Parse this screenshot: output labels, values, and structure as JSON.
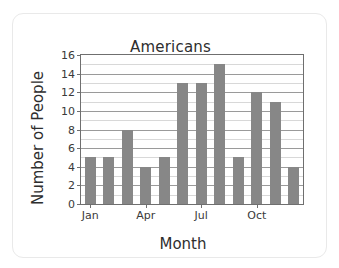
{
  "card": {
    "background": "#ffffff",
    "border_color": "#e9e9e9"
  },
  "chart_data": {
    "type": "bar",
    "title": "Americans",
    "xlabel": "Month",
    "ylabel": "Number of People",
    "categories": [
      "Jan",
      "Feb",
      "Mar",
      "Apr",
      "May",
      "Jun",
      "Jul",
      "Aug",
      "Sep",
      "Oct",
      "Nov",
      "Dec"
    ],
    "values": [
      5,
      5,
      8,
      4,
      5,
      13,
      13,
      15,
      5,
      12,
      11,
      4
    ],
    "ylim": [
      0,
      16
    ],
    "ytick_labels": [
      "0",
      "2",
      "4",
      "6",
      "8",
      "10",
      "12",
      "14",
      "16"
    ],
    "ytick_values": [
      0,
      2,
      4,
      6,
      8,
      10,
      12,
      14,
      16
    ],
    "xtick_labels": [
      "Jan",
      "Apr",
      "Jul",
      "Oct"
    ],
    "xtick_indices": [
      0,
      3,
      6,
      9
    ],
    "grid": true,
    "grid_minor_step": 1,
    "grid_major_step": 2,
    "legend": null,
    "bar_color": "#878787",
    "grid_major_color": "#9a9a9a",
    "grid_minor_color": "#d8d8d8",
    "axis_color": "#6f6f6f"
  }
}
